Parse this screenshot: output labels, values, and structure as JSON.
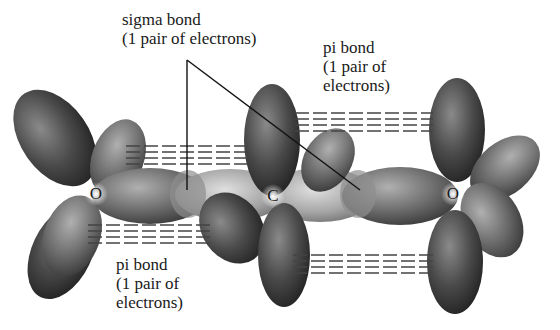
{
  "diagram": {
    "atoms": [
      {
        "symbol": "O",
        "x": 96,
        "y": 194
      },
      {
        "symbol": "C",
        "x": 273,
        "y": 196
      },
      {
        "symbol": "O",
        "x": 453,
        "y": 194
      }
    ],
    "labels": {
      "sigma": {
        "line1": "sigma bond",
        "line2": "(1 pair of electrons)"
      },
      "pi_top": {
        "line1": "pi bond",
        "line2": "(1 pair of",
        "line3": "electrons)"
      },
      "pi_bottom": {
        "line1": "pi bond",
        "line2": "(1 pair of",
        "line3": "electrons)"
      }
    },
    "colors": {
      "lobe_dark": "#2e2e2e",
      "lobe_mid": "#6a6a6a",
      "lobe_light": "#b5b5b5",
      "text": "#1a1a1a",
      "background": "#ffffff"
    }
  }
}
